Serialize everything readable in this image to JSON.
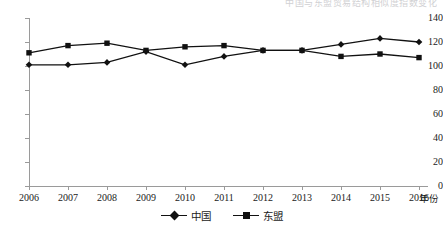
{
  "title_fragment": "中国与东盟贸易结构相似度指数变化",
  "axis": {
    "y_ticks": [
      "140",
      "120",
      "100",
      "80",
      "60",
      "40",
      "20",
      "0"
    ],
    "x_ticks": [
      "2006",
      "2007",
      "2008",
      "2009",
      "2010",
      "2011",
      "2012",
      "2013",
      "2014",
      "2015",
      "2016"
    ],
    "x_axis_name": "年份"
  },
  "legend": {
    "items": [
      {
        "label": "中国",
        "marker": "diamond",
        "color": "#111111"
      },
      {
        "label": "东盟",
        "marker": "square",
        "color": "#111111"
      }
    ]
  },
  "chart_data": {
    "type": "line",
    "title": "",
    "xlabel": "年份",
    "ylabel": "",
    "x": [
      2006,
      2007,
      2008,
      2009,
      2010,
      2011,
      2012,
      2013,
      2014,
      2015,
      2016
    ],
    "categories": [
      "2006",
      "2007",
      "2008",
      "2009",
      "2010",
      "2011",
      "2012",
      "2013",
      "2014",
      "2015",
      "2016"
    ],
    "series": [
      {
        "name": "中国",
        "marker": "diamond",
        "color": "#111111",
        "values": [
          101,
          101,
          103,
          112,
          101,
          108,
          113,
          113,
          118,
          123,
          120
        ]
      },
      {
        "name": "东盟",
        "marker": "square",
        "color": "#111111",
        "values": [
          111,
          117,
          119,
          113,
          116,
          117,
          113,
          113,
          108,
          110,
          107
        ]
      }
    ],
    "ylim": [
      0,
      140
    ],
    "ytick_step": 20,
    "xlim": [
      2006,
      2016
    ],
    "grid": false,
    "legend_position": "bottom-center"
  }
}
